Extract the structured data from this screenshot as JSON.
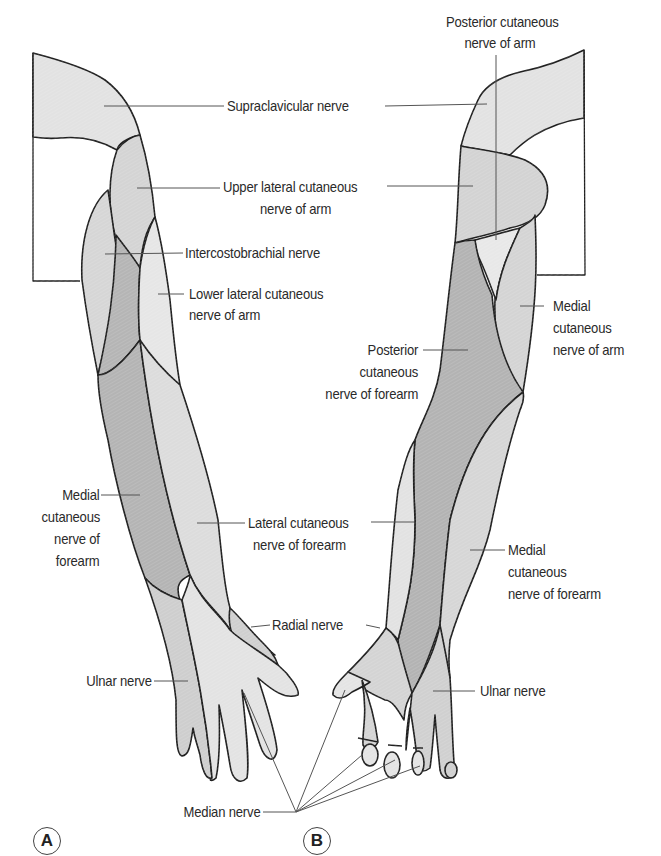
{
  "figure": {
    "panels": [
      {
        "id": "A",
        "label": "A",
        "view": "anterior"
      },
      {
        "id": "B",
        "label": "B",
        "view": "posterior"
      }
    ],
    "labels": {
      "supraclavicular": "Supraclavicular nerve",
      "posterior_arm_1": "Posterior cutaneous",
      "posterior_arm_2": "nerve of arm",
      "upper_lateral_1": "Upper lateral cutaneous",
      "upper_lateral_2": "nerve of arm",
      "intercostobrachial": "Intercostobrachial nerve",
      "lower_lateral_1": "Lower lateral cutaneous",
      "lower_lateral_2": "nerve of arm",
      "medial_arm_1": "Medial",
      "medial_arm_2": "cutaneous",
      "medial_arm_3": "nerve of arm",
      "posterior_forearm_1": "Posterior",
      "posterior_forearm_2": "cutaneous",
      "posterior_forearm_3": "nerve of forearm",
      "medial_forearm_A_1": "Medial",
      "medial_forearm_A_2": "cutaneous",
      "medial_forearm_A_3": "nerve of",
      "medial_forearm_A_4": "forearm",
      "lateral_forearm_1": "Lateral cutaneous",
      "lateral_forearm_2": "nerve of forearm",
      "medial_forearm_B_1": "Medial",
      "medial_forearm_B_2": "cutaneous",
      "medial_forearm_B_3": "nerve of forearm",
      "radial": "Radial nerve",
      "ulnar_A": "Ulnar nerve",
      "ulnar_B": "Ulnar nerve",
      "median": "Median nerve"
    },
    "colors": {
      "light": "#e4e4e4",
      "mid": "#d2d2d2",
      "dark": "#b3b3b3",
      "outline": "#1e1e1e",
      "leader": "#555555"
    }
  }
}
